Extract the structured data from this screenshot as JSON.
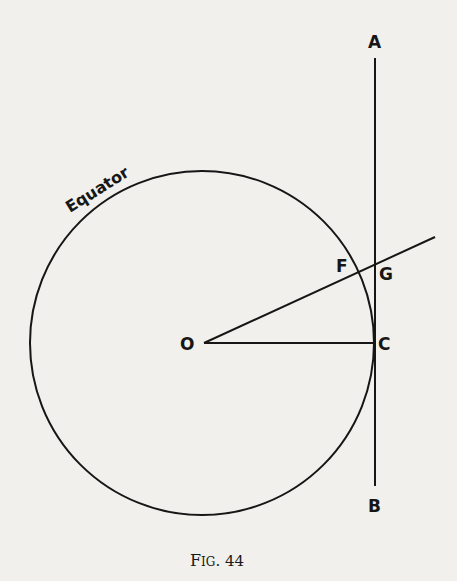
{
  "figure": {
    "caption": "Fig. 44",
    "caption_small_caps": "FIG. 44",
    "labels": {
      "equator": "Equator",
      "A": "A",
      "B": "B",
      "C": "C",
      "F": "F",
      "G": "G",
      "O": "O"
    },
    "colors": {
      "background": "#f1f0ec",
      "ink": "#161616"
    }
  }
}
